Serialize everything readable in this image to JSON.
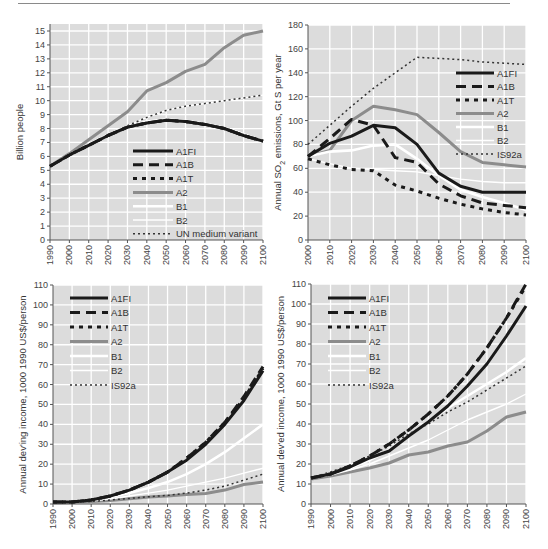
{
  "colors": {
    "plot_bg": "#dcdcdc",
    "grid": "#ffffff",
    "axis": "#555555",
    "A1FI": "#1a1a1a",
    "A1B": "#1a1a1a",
    "A1T": "#1a1a1a",
    "A2": "#8c8c8c",
    "B1": "#ffffff",
    "B2": "#ffffff",
    "ref": "#333333"
  },
  "chart_data": [
    {
      "id": "population",
      "type": "line",
      "title": "",
      "xlabel": "",
      "ylabel": "Billion people",
      "xlim": [
        1990,
        2100
      ],
      "ylim": [
        0,
        15
      ],
      "xticks": [
        1990,
        2000,
        2010,
        2020,
        2030,
        2040,
        2050,
        2060,
        2070,
        2080,
        2090,
        2100
      ],
      "yticks": [
        0,
        1,
        2,
        3,
        4,
        5,
        6,
        7,
        8,
        9,
        10,
        11,
        12,
        13,
        14,
        15
      ],
      "grid": true,
      "legend_position": "lower-center",
      "legend": [
        "A1FI",
        "A1B",
        "A1T",
        "A2",
        "B1",
        "B2",
        "UN medium variant"
      ],
      "series": [
        {
          "name": "A1FI",
          "x": [
            1990,
            2000,
            2010,
            2020,
            2030,
            2040,
            2050,
            2060,
            2070,
            2080,
            2090,
            2100
          ],
          "values": [
            5.3,
            6.1,
            6.8,
            7.5,
            8.1,
            8.4,
            8.6,
            8.5,
            8.3,
            8.0,
            7.5,
            7.1
          ]
        },
        {
          "name": "A1B",
          "x": [
            1990,
            2000,
            2010,
            2020,
            2030,
            2040,
            2050,
            2060,
            2070,
            2080,
            2090,
            2100
          ],
          "values": [
            5.3,
            6.1,
            6.8,
            7.5,
            8.1,
            8.4,
            8.6,
            8.5,
            8.3,
            8.0,
            7.5,
            7.1
          ]
        },
        {
          "name": "A1T",
          "x": [
            1990,
            2000,
            2010,
            2020,
            2030,
            2040,
            2050,
            2060,
            2070,
            2080,
            2090,
            2100
          ],
          "values": [
            5.3,
            6.1,
            6.8,
            7.5,
            8.1,
            8.4,
            8.6,
            8.5,
            8.3,
            8.0,
            7.5,
            7.1
          ]
        },
        {
          "name": "A2",
          "x": [
            1990,
            2000,
            2010,
            2020,
            2030,
            2040,
            2050,
            2060,
            2070,
            2080,
            2090,
            2100
          ],
          "values": [
            5.3,
            6.2,
            7.2,
            8.2,
            9.2,
            10.7,
            11.3,
            12.1,
            12.6,
            13.8,
            14.7,
            15.0
          ]
        },
        {
          "name": "B1",
          "x": [
            1990,
            2000,
            2010,
            2020,
            2030,
            2040,
            2050,
            2060,
            2070,
            2080,
            2090,
            2100
          ],
          "values": [
            5.3,
            6.1,
            6.8,
            7.5,
            8.1,
            8.5,
            8.65,
            8.55,
            8.35,
            8.05,
            7.6,
            7.1
          ]
        },
        {
          "name": "B2",
          "x": [
            1990,
            2000,
            2010,
            2020,
            2030,
            2040,
            2050,
            2060,
            2070,
            2080,
            2090,
            2100
          ],
          "values": [
            5.3,
            6.1,
            6.9,
            7.6,
            8.2,
            8.8,
            9.3,
            9.6,
            9.8,
            10.0,
            10.2,
            10.4
          ]
        },
        {
          "name": "UN medium variant",
          "x": [
            2000,
            2010,
            2020,
            2030,
            2040,
            2050,
            2060,
            2070,
            2080,
            2090,
            2100
          ],
          "values": [
            6.1,
            6.8,
            7.5,
            8.2,
            8.8,
            9.3,
            9.6,
            9.8,
            10.0,
            10.2,
            10.4
          ]
        }
      ]
    },
    {
      "id": "so2",
      "type": "line",
      "title": "",
      "xlabel": "",
      "ylabel": "Annual SO2 emissions, Gt S per year",
      "xlim": [
        2000,
        2100
      ],
      "ylim": [
        0,
        180
      ],
      "xticks": [
        2000,
        2010,
        2020,
        2030,
        2040,
        2050,
        2060,
        2070,
        2080,
        2090,
        2100
      ],
      "yticks": [
        0,
        20,
        40,
        60,
        80,
        100,
        120,
        140,
        160,
        180
      ],
      "grid": true,
      "legend_position": "upper-right",
      "legend": [
        "A1FI",
        "A1B",
        "A1T",
        "A2",
        "B1",
        "B2",
        "IS92a"
      ],
      "series": [
        {
          "name": "A1FI",
          "x": [
            2000,
            2010,
            2020,
            2030,
            2040,
            2050,
            2060,
            2070,
            2080,
            2090,
            2100
          ],
          "values": [
            70,
            81,
            87,
            96,
            94,
            80,
            56,
            45,
            40,
            40,
            40
          ]
        },
        {
          "name": "A1B",
          "x": [
            2000,
            2010,
            2020,
            2030,
            2040,
            2050,
            2060,
            2070,
            2080,
            2090,
            2100
          ],
          "values": [
            70,
            85,
            101,
            96,
            69,
            65,
            47,
            37,
            31,
            29,
            27
          ]
        },
        {
          "name": "A1T",
          "x": [
            2000,
            2010,
            2020,
            2030,
            2040,
            2050,
            2060,
            2070,
            2080,
            2090,
            2100
          ],
          "values": [
            68,
            63,
            59,
            58,
            46,
            41,
            35,
            30,
            26,
            23,
            21
          ]
        },
        {
          "name": "A2",
          "x": [
            2000,
            2010,
            2020,
            2030,
            2040,
            2050,
            2060,
            2070,
            2080,
            2090,
            2100
          ],
          "values": [
            70,
            75,
            100,
            112,
            109,
            105,
            90,
            74,
            65,
            63,
            61
          ]
        },
        {
          "name": "B1",
          "x": [
            2000,
            2010,
            2020,
            2030,
            2040,
            2050,
            2060,
            2070,
            2080,
            2090,
            2100
          ],
          "values": [
            70,
            74,
            75,
            79,
            80,
            68,
            54,
            42,
            36,
            31,
            25
          ]
        },
        {
          "name": "B2",
          "x": [
            2000,
            2010,
            2020,
            2030,
            2040,
            2050,
            2060,
            2070,
            2080,
            2090,
            2100
          ],
          "values": [
            68,
            64,
            60,
            59,
            58,
            57,
            54,
            51,
            49,
            48,
            48
          ]
        },
        {
          "name": "IS92a",
          "x": [
            2000,
            2010,
            2020,
            2030,
            2040,
            2050,
            2060,
            2070,
            2080,
            2090,
            2100
          ],
          "values": [
            80,
            96,
            112,
            127,
            140,
            153,
            152,
            151,
            149,
            148,
            147
          ]
        }
      ]
    },
    {
      "id": "developing-income",
      "type": "line",
      "title": "",
      "xlabel": "",
      "ylabel": "Annual dev'ing income, 1000 1990 US$/person",
      "xlim": [
        1990,
        2100
      ],
      "ylim": [
        0,
        110
      ],
      "xticks": [
        1990,
        2000,
        2010,
        2020,
        2030,
        2040,
        2050,
        2060,
        2070,
        2080,
        2090,
        2100
      ],
      "yticks": [
        0,
        10,
        20,
        30,
        40,
        50,
        60,
        70,
        80,
        90,
        100,
        110
      ],
      "grid": true,
      "legend_position": "upper-left",
      "legend": [
        "A1FI",
        "A1B",
        "A1T",
        "A2",
        "B1",
        "B2",
        "IS92a"
      ],
      "series": [
        {
          "name": "A1FI",
          "x": [
            1990,
            2000,
            2010,
            2020,
            2030,
            2040,
            2050,
            2060,
            2070,
            2080,
            2090,
            2100
          ],
          "values": [
            1,
            1,
            2,
            4,
            7,
            11,
            16,
            22,
            30,
            40,
            52,
            67
          ]
        },
        {
          "name": "A1B",
          "x": [
            1990,
            2000,
            2010,
            2020,
            2030,
            2040,
            2050,
            2060,
            2070,
            2080,
            2090,
            2100
          ],
          "values": [
            1,
            1,
            2,
            4,
            7,
            11,
            16,
            23,
            31,
            41,
            54,
            69
          ]
        },
        {
          "name": "A1T",
          "x": [
            1990,
            2000,
            2010,
            2020,
            2030,
            2040,
            2050,
            2060,
            2070,
            2080,
            2090,
            2100
          ],
          "values": [
            1,
            1,
            2,
            4,
            7,
            11,
            16,
            23,
            31,
            41,
            53,
            68
          ]
        },
        {
          "name": "A2",
          "x": [
            1990,
            2000,
            2010,
            2020,
            2030,
            2040,
            2050,
            2060,
            2070,
            2080,
            2090,
            2100
          ],
          "values": [
            0.5,
            0.8,
            1.2,
            1.8,
            2.6,
            3.5,
            4.0,
            4.7,
            5.3,
            7.0,
            9.8,
            11
          ]
        },
        {
          "name": "B1",
          "x": [
            1990,
            2000,
            2010,
            2020,
            2030,
            2040,
            2050,
            2060,
            2070,
            2080,
            2090,
            2100
          ],
          "values": [
            1,
            1,
            2,
            3.5,
            5.5,
            8,
            11,
            15,
            20,
            26,
            33,
            40
          ]
        },
        {
          "name": "B2",
          "x": [
            1990,
            2000,
            2010,
            2020,
            2030,
            2040,
            2050,
            2060,
            2070,
            2080,
            2090,
            2100
          ],
          "values": [
            1,
            1,
            1.5,
            2.5,
            4,
            5.5,
            7,
            9,
            11,
            13,
            15.5,
            18
          ]
        },
        {
          "name": "IS92a",
          "x": [
            1990,
            2000,
            2010,
            2020,
            2030,
            2040,
            2050,
            2060,
            2070,
            2080,
            2090,
            2100
          ],
          "values": [
            0.8,
            1,
            1.3,
            2,
            2.8,
            3.6,
            4.3,
            5.5,
            7,
            9,
            12,
            15
          ]
        }
      ]
    },
    {
      "id": "developed-income",
      "type": "line",
      "title": "",
      "xlabel": "",
      "ylabel": "Annual dev'ed income, 1000 1990 US$/person",
      "xlim": [
        1990,
        2100
      ],
      "ylim": [
        0,
        110
      ],
      "xticks": [
        1990,
        2000,
        2010,
        2020,
        2030,
        2040,
        2050,
        2060,
        2070,
        2080,
        2090,
        2100
      ],
      "yticks": [
        0,
        10,
        20,
        30,
        40,
        50,
        60,
        70,
        80,
        90,
        100,
        110
      ],
      "grid": true,
      "legend_position": "upper-left",
      "legend": [
        "A1FI",
        "A1B",
        "A1T",
        "A2",
        "B1",
        "B2",
        "IS92a"
      ],
      "series": [
        {
          "name": "A1FI",
          "x": [
            1990,
            2000,
            2010,
            2020,
            2030,
            2040,
            2050,
            2060,
            2070,
            2080,
            2090,
            2100
          ],
          "values": [
            13,
            15,
            18.5,
            23,
            26.5,
            34,
            41,
            49,
            59,
            70,
            84,
            99
          ]
        },
        {
          "name": "A1B",
          "x": [
            1990,
            2000,
            2010,
            2020,
            2030,
            2040,
            2050,
            2060,
            2070,
            2080,
            2090,
            2100
          ],
          "values": [
            13,
            15,
            19,
            24,
            30,
            37,
            45,
            54,
            65,
            78,
            93,
            110
          ]
        },
        {
          "name": "A1T",
          "x": [
            1990,
            2000,
            2010,
            2020,
            2030,
            2040,
            2050,
            2060,
            2070,
            2080,
            2090,
            2100
          ],
          "values": [
            13,
            15,
            19,
            24,
            30,
            37,
            45,
            54,
            65,
            78,
            93,
            109
          ]
        },
        {
          "name": "A2",
          "x": [
            1990,
            2000,
            2010,
            2020,
            2030,
            2040,
            2050,
            2060,
            2070,
            2080,
            2090,
            2100
          ],
          "values": [
            12.5,
            14,
            16,
            18,
            20.5,
            24.5,
            26,
            29,
            31,
            36.5,
            43.5,
            46
          ]
        },
        {
          "name": "B1",
          "x": [
            1990,
            2000,
            2010,
            2020,
            2030,
            2040,
            2050,
            2060,
            2070,
            2080,
            2090,
            2100
          ],
          "values": [
            13,
            15,
            18,
            22,
            27,
            34,
            41,
            48,
            54,
            60,
            66,
            73
          ]
        },
        {
          "name": "B2",
          "x": [
            1990,
            2000,
            2010,
            2020,
            2030,
            2040,
            2050,
            2060,
            2070,
            2080,
            2090,
            2100
          ],
          "values": [
            13,
            14.5,
            17,
            20,
            24,
            28,
            32,
            37,
            42,
            46,
            50,
            55
          ]
        },
        {
          "name": "IS92a",
          "x": [
            1990,
            2000,
            2010,
            2020,
            2030,
            2040,
            2050,
            2060,
            2070,
            2080,
            2090,
            2100
          ],
          "values": [
            13,
            16,
            19.5,
            24,
            29,
            35,
            40,
            46,
            51,
            57,
            63,
            69
          ]
        }
      ]
    }
  ],
  "panels": [
    {
      "frame": {
        "left": 50,
        "top": 31,
        "right": 263,
        "bottom": 240,
        "frame_top": 24
      }
    },
    {
      "frame": {
        "left": 308,
        "top": 25,
        "right": 526,
        "bottom": 240,
        "frame_top": 25
      }
    },
    {
      "frame": {
        "left": 53,
        "top": 285,
        "right": 263,
        "bottom": 504,
        "frame_top": 285
      }
    },
    {
      "frame": {
        "left": 311,
        "top": 284,
        "right": 526,
        "bottom": 504,
        "frame_top": 284
      }
    }
  ],
  "legend_layout": [
    {
      "x": 133,
      "y": 151,
      "row": 13.8,
      "line_w": 40
    },
    {
      "x": 456,
      "y": 73,
      "row": 13.5,
      "line_w": 38
    },
    {
      "x": 70,
      "y": 298,
      "row": 14.5,
      "line_w": 38
    },
    {
      "x": 328,
      "y": 298,
      "row": 14.5,
      "line_w": 38
    }
  ],
  "styles": {
    "A1FI": {
      "width": 3,
      "dash": ""
    },
    "A1B": {
      "width": 3,
      "dash": "10,6"
    },
    "A1T": {
      "width": 3,
      "dash": "4,5"
    },
    "A2": {
      "width": 3,
      "dash": ""
    },
    "B1": {
      "width": 2.6,
      "dash": ""
    },
    "B2": {
      "width": 1.4,
      "dash": ""
    },
    "UN medium variant": {
      "width": 1.5,
      "dash": "2,3"
    },
    "IS92a": {
      "width": 1.5,
      "dash": "2,3"
    }
  }
}
